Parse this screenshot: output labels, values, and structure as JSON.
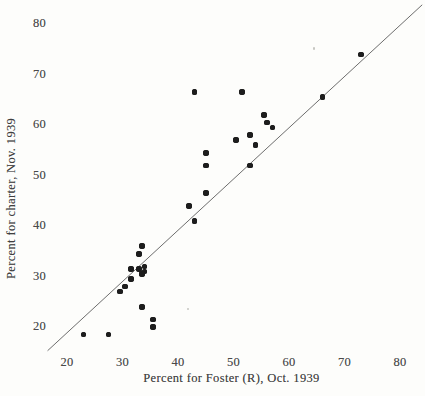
{
  "figure": {
    "background": "#fdfdfb",
    "dot_color": "#1d1d1d",
    "line_color": "#5c5c5c",
    "text_color": "#3f3f3f"
  },
  "chart_data": {
    "type": "scatter",
    "title": "",
    "xlabel": "Percent for Foster (R), Oct. 1939",
    "ylabel": "Percent for charter, Nov. 1939",
    "xlim": [
      15,
      85
    ],
    "ylim": [
      15,
      85
    ],
    "xticks": [
      20,
      30,
      40,
      50,
      60,
      70,
      80
    ],
    "yticks": [
      20,
      30,
      40,
      50,
      60,
      70,
      80
    ],
    "grid": false,
    "legend": null,
    "points": [
      [
        73,
        74
      ],
      [
        66,
        65.5
      ],
      [
        51.5,
        66.5
      ],
      [
        43,
        66.5
      ],
      [
        55.5,
        62
      ],
      [
        56,
        60.5
      ],
      [
        57,
        59.5
      ],
      [
        53,
        58
      ],
      [
        50.5,
        57
      ],
      [
        54,
        56
      ],
      [
        45,
        54.5
      ],
      [
        45,
        52
      ],
      [
        53,
        52
      ],
      [
        45,
        46.5
      ],
      [
        42,
        44
      ],
      [
        43,
        41
      ],
      [
        33.5,
        36
      ],
      [
        33,
        34.5
      ],
      [
        34,
        32
      ],
      [
        31.5,
        31.5
      ],
      [
        33,
        31.5
      ],
      [
        34,
        31
      ],
      [
        33.5,
        30.5
      ],
      [
        31.5,
        29.5
      ],
      [
        30.5,
        28
      ],
      [
        29.5,
        27
      ],
      [
        33.5,
        24
      ],
      [
        35.5,
        21.5
      ],
      [
        35.5,
        20
      ],
      [
        27.5,
        18.5
      ],
      [
        23,
        18.5
      ]
    ],
    "reference_line": {
      "description": "45-degree identity line (y = x)",
      "x1": 16.5,
      "y1": 15.3,
      "x2": 84,
      "y2": 83.8
    },
    "artifacts": [
      [
        64.5,
        75.2
      ],
      [
        41.8,
        23.6
      ]
    ]
  }
}
